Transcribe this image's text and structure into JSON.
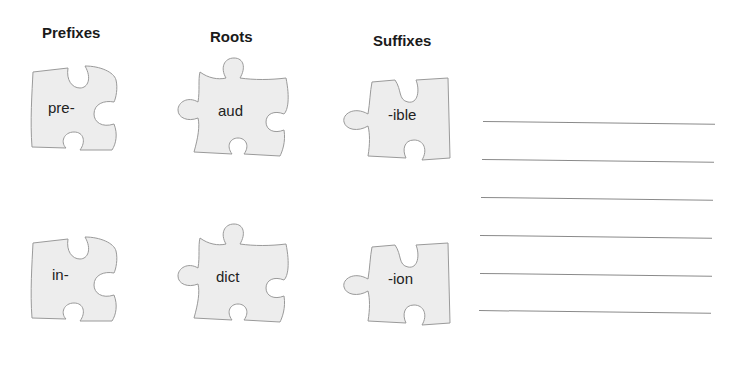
{
  "headers": {
    "prefixes": "Prefixes",
    "roots": "Roots",
    "suffixes": "Suffixes"
  },
  "pieces": {
    "prefixes": [
      "pre-",
      "in-"
    ],
    "roots": [
      "aud",
      "dict"
    ],
    "suffixes": [
      "-ible",
      "-ion"
    ]
  },
  "answer_lines": {
    "count": 6
  },
  "colors": {
    "piece_fill": "#ededed",
    "piece_stroke": "#9a9a9a",
    "line": "#8a8a8a"
  }
}
